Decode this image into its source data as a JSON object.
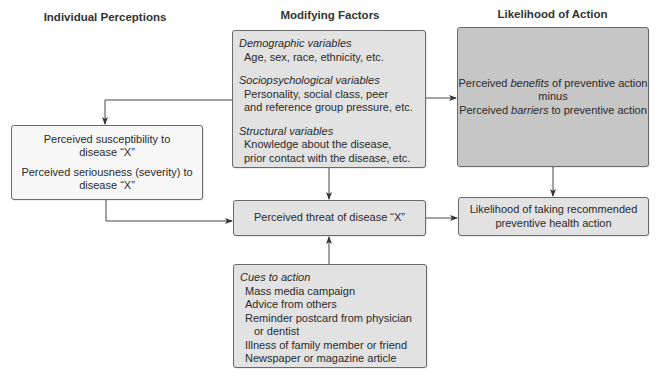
{
  "headers": {
    "individual": "Individual Perceptions",
    "modifying": "Modifying Factors",
    "likelihood": "Likelihood of Action"
  },
  "modifying_box": {
    "groups": [
      {
        "title": "Demographic variables",
        "items": [
          "Age, sex, race, ethnicity, etc."
        ]
      },
      {
        "title": "Sociopsychological variables",
        "items": [
          "Personality, social class, peer",
          "and reference group pressure, etc."
        ]
      },
      {
        "title": "Structural variables",
        "items": [
          "Knowledge about the disease,",
          "prior contact with the disease, etc."
        ]
      }
    ]
  },
  "individual_box": {
    "line1a": "Perceived susceptibility to",
    "line1b": "disease “X”",
    "line2a": "Perceived seriousness (severity) to",
    "line2b": "disease “X”"
  },
  "threat_box": {
    "label": "Perceived threat of disease “X”"
  },
  "benefits_box": {
    "line1_pre": "Perceived ",
    "line1_em": "benefits",
    "line1_post": " of preventive action",
    "line2": "minus",
    "line3_pre": "Perceived ",
    "line3_em": "barriers",
    "line3_post": " to preventive action"
  },
  "action_box": {
    "line1": "Likelihood of taking recommended",
    "line2": "preventive health action"
  },
  "cues_box": {
    "title": "Cues to action",
    "items": [
      "Mass media campaign",
      "Advice from others",
      "Reminder postcard from physician",
      "or dentist",
      "Illness of family member or friend",
      "Newspaper or magazine article"
    ]
  },
  "colors": {
    "light_box": "#f7f7f7",
    "mid_box": "#e2e2e2",
    "dark_box": "#c6c6c6",
    "line": "#444444"
  }
}
